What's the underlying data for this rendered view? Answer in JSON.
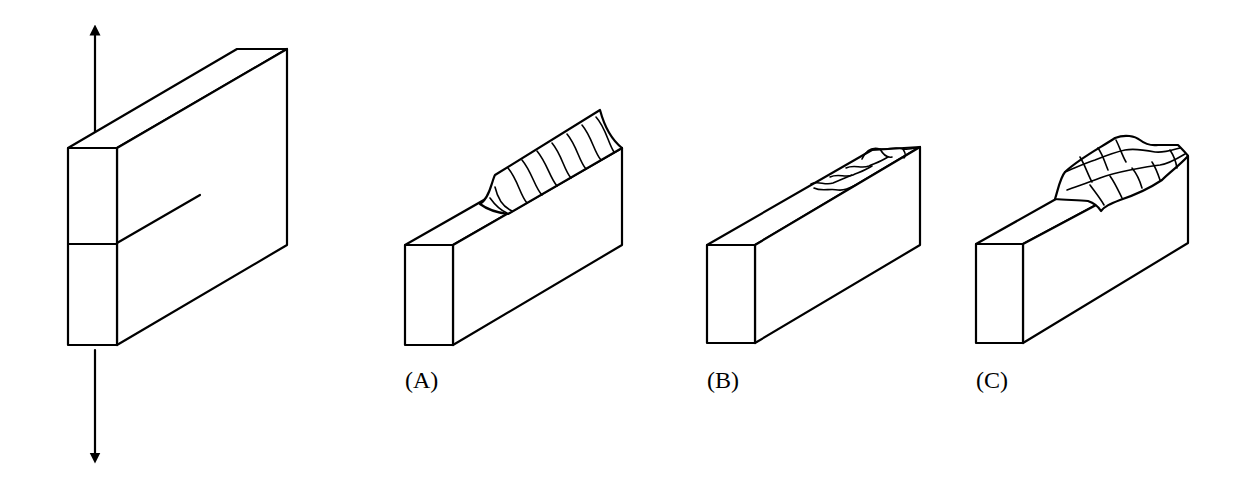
{
  "figure": {
    "title": "",
    "loaded_plate": {
      "load_arrows": [
        "tension-up",
        "tension-down"
      ],
      "has_crack": true
    },
    "panels": [
      {
        "id": "A",
        "label": "(A)",
        "mode": "opening"
      },
      {
        "id": "B",
        "label": "(B)",
        "mode": "sliding"
      },
      {
        "id": "C",
        "label": "(C)",
        "mode": "tearing"
      }
    ],
    "colors": {
      "line": "#000000",
      "background": "#ffffff"
    }
  }
}
